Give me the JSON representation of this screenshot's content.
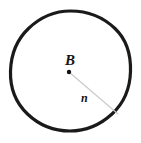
{
  "figure": {
    "type": "geometry-diagram",
    "background_color": "#ffffff",
    "canvas": {
      "width": 141,
      "height": 143
    }
  },
  "circle": {
    "name": "circle-outline",
    "center_x": 70.5,
    "center_y": 71,
    "radius": 60,
    "stroke_color": "#1a1a1a",
    "stroke_width": 3.2,
    "fill": "none"
  },
  "center_point": {
    "name": "center-point",
    "x": 69,
    "y": 72,
    "radius": 2.2,
    "color": "#111111"
  },
  "radius_segment": {
    "name": "radius-line",
    "x1": 69,
    "y1": 72,
    "x2": 118,
    "y2": 114,
    "stroke_color": "#c9c9c9",
    "stroke_width": 1.1
  },
  "labels": {
    "center": {
      "text": "B",
      "font_size": 15,
      "color": "#141414",
      "style": "bold-italic-serif"
    },
    "radius": {
      "text": "n",
      "font_size": 12,
      "color": "#141414",
      "style": "bold-italic-serif"
    }
  }
}
